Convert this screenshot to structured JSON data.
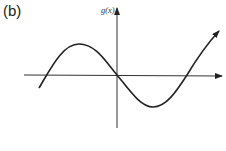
{
  "figure": {
    "panel_label": "(b)",
    "y_axis_label": "g(x)",
    "x_axis_label": "",
    "colors": {
      "stroke": "#222222",
      "background": "#ffffff"
    }
  }
}
